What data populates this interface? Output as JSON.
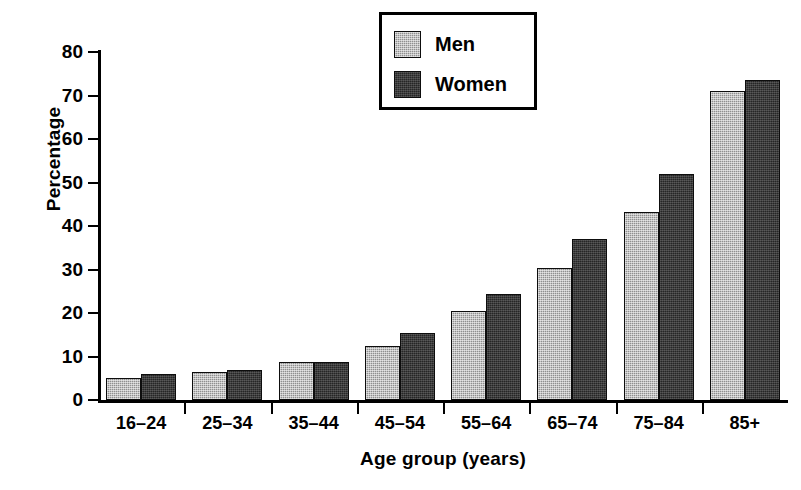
{
  "chart_data": {
    "type": "bar",
    "title": "",
    "xlabel": "Age group (years)",
    "ylabel": "Percentage",
    "categories": [
      "16–24",
      "25–34",
      "35–44",
      "45–54",
      "55–64",
      "65–74",
      "75–84",
      "85+"
    ],
    "series": [
      {
        "name": "Men",
        "color": "#8f8f8f",
        "values": [
          5.1,
          6.5,
          8.8,
          12.3,
          20.5,
          30.3,
          43.2,
          71.0
        ]
      },
      {
        "name": "Women",
        "color": "#262626",
        "values": [
          6.0,
          7.0,
          8.7,
          15.3,
          24.3,
          37.0,
          52.0,
          73.6
        ]
      }
    ],
    "ylim": [
      0,
      80
    ],
    "yticks": [
      0,
      10,
      20,
      30,
      40,
      50,
      60,
      70,
      80
    ],
    "ytick_labels": [
      "0",
      "10",
      "20",
      "30",
      "40",
      "50",
      "60",
      "70",
      "80"
    ],
    "grid": false,
    "legend_position": "top-center-right",
    "axis_color": "#000000",
    "background": "#ffffff"
  }
}
